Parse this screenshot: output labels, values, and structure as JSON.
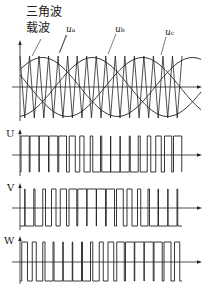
{
  "diagram": {
    "type": "SPWM three-phase modulation",
    "annotations": {
      "triangle_wave": "三角波",
      "carrier_wave": "载波"
    },
    "signals": [
      {
        "id": "ua",
        "label": "u",
        "subscript": "a",
        "phase_deg": 0
      },
      {
        "id": "ub",
        "label": "u",
        "subscript": "b",
        "phase_deg": -120
      },
      {
        "id": "uc",
        "label": "u",
        "subscript": "c",
        "phase_deg": -240
      }
    ],
    "outputs": [
      {
        "id": "U",
        "label": "U",
        "compare": "ua"
      },
      {
        "id": "V",
        "label": "V",
        "compare": "ub"
      },
      {
        "id": "W",
        "label": "W",
        "compare": "uc"
      }
    ],
    "carrier_cycles": 17,
    "modulation_index": 0.95,
    "colors": {
      "line": "#222222",
      "background": "#ffffff"
    }
  }
}
